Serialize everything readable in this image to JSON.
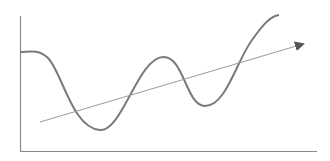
{
  "diagram": {
    "colors": {
      "axes": "#8a8a8a",
      "curve": "#7a7a7a",
      "trend": "#9a9a9a",
      "arrowhead": "#555555",
      "background": "#ffffff"
    },
    "axes": {
      "y_axis": {
        "x": 20,
        "y_top": 16,
        "y_bottom": 151
      },
      "x_axis": {
        "y": 151,
        "x_left": 20,
        "x_right": 317
      }
    },
    "curve": {
      "points": [
        [
          20,
          52
        ],
        [
          40,
          53
        ],
        [
          100,
          130
        ],
        [
          163,
          57
        ],
        [
          202,
          105
        ],
        [
          279,
          15
        ]
      ]
    },
    "trend_arrow": {
      "from": [
        40,
        122
      ],
      "to": [
        305,
        43
      ]
    }
  }
}
